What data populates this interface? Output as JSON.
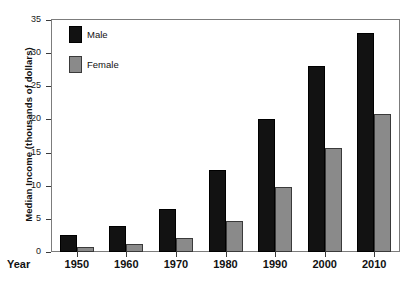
{
  "chart_data": {
    "type": "bar",
    "title": "",
    "xlabel": "Year",
    "ylabel": "Median Income (thousands of dollars)",
    "categories": [
      "1950",
      "1960",
      "1970",
      "1980",
      "1990",
      "2000",
      "2010"
    ],
    "series": [
      {
        "name": "Male",
        "color": "#121212",
        "values": [
          2.5,
          4.0,
          6.5,
          12.3,
          20.0,
          28.0,
          33.0
        ]
      },
      {
        "name": "Female",
        "color": "#8a8a8a",
        "values": [
          0.8,
          1.2,
          2.1,
          4.7,
          9.8,
          15.7,
          20.8
        ]
      }
    ],
    "ylim": [
      0,
      35
    ],
    "yticks": [
      "0",
      "5",
      "10",
      "15",
      "20",
      "25",
      "30",
      "35"
    ],
    "ytick_values": [
      0,
      5,
      10,
      15,
      20,
      25,
      30,
      35
    ],
    "grid": false,
    "legend_position": "top-left"
  },
  "axis": {
    "y_title": "Median Income (thousands of dollars)",
    "x_title": "Year"
  },
  "legend": {
    "items": [
      {
        "label": "Male"
      },
      {
        "label": "Female"
      }
    ]
  }
}
